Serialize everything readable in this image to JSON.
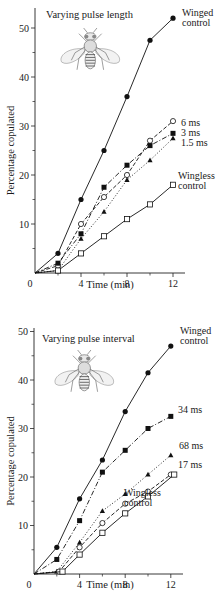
{
  "chart_data": [
    {
      "type": "line",
      "title": "Varying pulse length",
      "xlabel": "Time (min)",
      "ylabel": "Percentage copulated",
      "xlim": [
        0,
        13
      ],
      "ylim": [
        0,
        55
      ],
      "xticks": [
        0,
        4,
        8,
        12
      ],
      "xminor": [
        2,
        6,
        10
      ],
      "yticks": [
        10,
        20,
        30,
        40,
        50
      ],
      "yminor": [
        5,
        15,
        25,
        35,
        45
      ],
      "grid": false,
      "legend_position": "inline-right",
      "series": [
        {
          "name": "Winged control",
          "label_lines": [
            "Winged",
            "control"
          ],
          "marker": "filled-circle",
          "line": "solid",
          "x": [
            0,
            2,
            4,
            6,
            8,
            10,
            12
          ],
          "y": [
            0,
            4,
            15,
            25,
            36,
            47.5,
            52
          ]
        },
        {
          "name": "6 ms",
          "label_lines": [
            "6 ms"
          ],
          "marker": "open-circle",
          "line": "dashed",
          "x": [
            0,
            2,
            4,
            6,
            8,
            10,
            12
          ],
          "y": [
            0,
            1.5,
            10,
            15.5,
            20,
            27,
            31
          ]
        },
        {
          "name": "3 ms",
          "label_lines": [
            "3 ms"
          ],
          "marker": "filled-square",
          "line": "dash-dot",
          "x": [
            0,
            2,
            4,
            6,
            8,
            10,
            12
          ],
          "y": [
            0,
            2,
            8,
            17.5,
            22,
            26,
            28.5
          ]
        },
        {
          "name": "1.5 ms",
          "label_lines": [
            "1.5 ms"
          ],
          "marker": "filled-triangle",
          "line": "dotted",
          "x": [
            0,
            2,
            4,
            6,
            8,
            10,
            12
          ],
          "y": [
            0,
            0.5,
            7,
            12.5,
            19,
            23,
            27.5
          ]
        },
        {
          "name": "Wingless control",
          "label_lines": [
            "Wingless",
            "control"
          ],
          "marker": "open-square",
          "line": "solid",
          "x": [
            0,
            2,
            4,
            6,
            8,
            10,
            12
          ],
          "y": [
            0,
            0.5,
            4,
            7.5,
            11,
            14,
            18
          ]
        }
      ]
    },
    {
      "type": "line",
      "title": "Varying pulse interval",
      "xlabel": "Time (min)",
      "ylabel": "Percentage copulated",
      "xlim": [
        0,
        13
      ],
      "ylim": [
        0,
        50
      ],
      "xticks": [
        0,
        4,
        8,
        12
      ],
      "xminor": [
        2,
        6,
        10
      ],
      "yticks": [
        10,
        20,
        30,
        40,
        50
      ],
      "yminor": [
        5,
        15,
        25,
        35,
        45
      ],
      "grid": false,
      "legend_position": "inline-right",
      "series": [
        {
          "name": "Winged control",
          "label_lines": [
            "Winged",
            "control"
          ],
          "marker": "filled-circle",
          "line": "solid",
          "x": [
            0,
            2,
            4,
            6,
            8,
            10,
            12
          ],
          "y": [
            0,
            5.5,
            15.5,
            23.5,
            33.5,
            41.5,
            47
          ]
        },
        {
          "name": "34 ms",
          "label_lines": [
            "34 ms"
          ],
          "marker": "filled-square",
          "line": "dash-dot",
          "x": [
            0,
            2,
            4,
            6,
            8,
            10,
            12
          ],
          "y": [
            0,
            3,
            11,
            21,
            25.5,
            30,
            32.5
          ]
        },
        {
          "name": "68 ms",
          "label_lines": [
            "68 ms"
          ],
          "marker": "filled-triangle",
          "line": "dotted",
          "x": [
            0,
            2,
            4,
            6,
            8,
            10,
            12
          ],
          "y": [
            0,
            0.5,
            6.5,
            13,
            16.5,
            20.5,
            24.5
          ]
        },
        {
          "name": "17 ms",
          "label_lines": [
            "17 ms"
          ],
          "marker": "open-circle",
          "line": "dashed",
          "x": [
            0,
            2.2,
            4,
            6,
            8,
            10,
            12
          ],
          "y": [
            0,
            0.5,
            5.5,
            10.5,
            14.5,
            17,
            20.5
          ]
        },
        {
          "name": "Wingless control",
          "label_lines": [
            "Wingless",
            "control"
          ],
          "marker": "open-square",
          "line": "solid",
          "x": [
            0,
            2.5,
            4,
            6,
            8,
            10,
            12.3
          ],
          "y": [
            0,
            0.5,
            4,
            8.5,
            12.5,
            16,
            20.5
          ]
        }
      ]
    }
  ],
  "panels": [
    {
      "title": "Varying pulse length",
      "xlabel": "Time (min)",
      "ylabel": "Percentage copulated",
      "illustration": "fruit-fly-drawing"
    },
    {
      "title": "Varying pulse interval",
      "xlabel": "Time (min)",
      "ylabel": "Percentage copulated",
      "illustration": "fruit-fly-drawing"
    }
  ],
  "layout": [
    {
      "ox": 35,
      "oy": 273,
      "pxPerX": 11.5,
      "pxPerY": 4.9,
      "axisEndX": 185,
      "axisTopY": 8,
      "titlePos": [
        46,
        18
      ],
      "flyPos": [
        58,
        28
      ],
      "labels": {
        "Winged control": [
          182,
          16
        ],
        "6 ms": [
          181,
          126
        ],
        "3 ms": [
          181,
          136
        ],
        "1.5 ms": [
          181,
          146
        ],
        "Wingless control": [
          178,
          179
        ]
      },
      "xlabelPos": [
        110,
        302
      ]
    },
    {
      "ox": 34,
      "oy": 274,
      "pxPerX": 11.4,
      "pxPerY": 4.85,
      "axisEndX": 183,
      "axisTopY": 28,
      "titlePos": [
        42,
        42
      ],
      "flyPos": [
        52,
        50
      ],
      "labels": {
        "Winged control": [
          180,
          34
        ],
        "34 ms": [
          178,
          113
        ],
        "68 ms": [
          179,
          149
        ],
        "17 ms": [
          178,
          168
        ],
        "Wingless control": [
          124,
          196
        ]
      },
      "xlabelPos": [
        110,
        302
      ]
    }
  ]
}
